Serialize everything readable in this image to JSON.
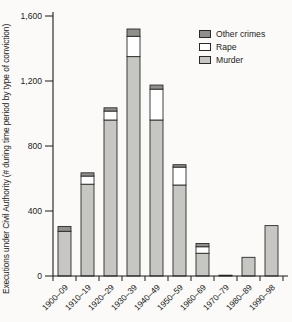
{
  "figure": {
    "background": "#fbfaf8",
    "axis_color": "#1a1a1a"
  },
  "chart_data": {
    "type": "bar",
    "stacked": true,
    "title": "",
    "xlabel": "",
    "ylabel": "Executions under Civil Authority (# during time period by type of conviction)",
    "categories": [
      "1900–09",
      "1910–19",
      "1920–29",
      "1930–39",
      "1940–49",
      "1950–59",
      "1960–69",
      "1970–79",
      "1980–89",
      "1990–98"
    ],
    "series": [
      {
        "name": "Murder",
        "color": "#c6c6c2",
        "values": [
          275,
          565,
          960,
          1350,
          960,
          560,
          140,
          5,
          115,
          310
        ]
      },
      {
        "name": "Rape",
        "color": "#ffffff",
        "values": [
          0,
          50,
          55,
          125,
          190,
          110,
          40,
          0,
          0,
          0
        ]
      },
      {
        "name": "Other crimes",
        "color": "#8f8f8b",
        "values": [
          30,
          20,
          20,
          45,
          25,
          15,
          20,
          0,
          0,
          0
        ]
      }
    ],
    "legend_order": [
      "Other crimes",
      "Rape",
      "Murder"
    ],
    "legend_position": "top-right",
    "y_ticks": [
      0,
      400,
      800,
      1200,
      1600
    ],
    "y_tick_labels": [
      "0",
      "400",
      "800",
      "1,200",
      "1,600"
    ],
    "ylim": [
      0,
      1650
    ],
    "grid": false
  }
}
